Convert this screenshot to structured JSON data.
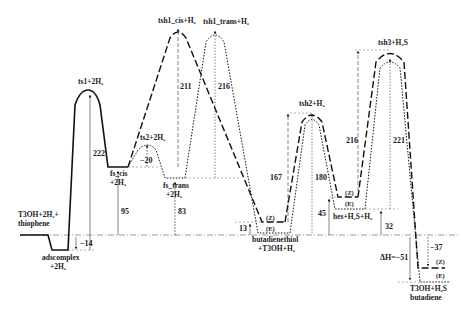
{
  "diagram": {
    "type": "reaction-energy-profile",
    "baseline_label": "T3OH+2H₂+ thiophene",
    "states": [
      {
        "id": "start",
        "label_line1": "T3OH+2H₂+",
        "label_line2": "thiophene",
        "energy": 0
      },
      {
        "id": "adscomplex",
        "label_line1": "adscomplex",
        "label_line2": "+2H₂",
        "energy": -14
      },
      {
        "id": "ts1",
        "label": "ts1+2H₂",
        "barrier": 222
      },
      {
        "id": "fs_cis",
        "label_line1": "fs_cis",
        "label_line2": "+2H₂",
        "energy": 95
      },
      {
        "id": "ts2",
        "label": "ts2+2H₂",
        "barrier": -20
      },
      {
        "id": "fs_trans",
        "label_line1": "fs_trans",
        "label_line2": "+2H₂",
        "energy": 83
      },
      {
        "id": "tsh1_cis",
        "label": "tsh1_cis+H₂",
        "barrier": 211
      },
      {
        "id": "tsh1_trans",
        "label": "tsh1_trans+H₂",
        "barrier": 216
      },
      {
        "id": "butadienethiol",
        "label_line1": "butadienethiol",
        "label_line2": "+T3OH+H₂",
        "energy": 13,
        "isomers": [
          "(Z)",
          "(E)"
        ]
      },
      {
        "id": "tsh2",
        "label": "tsh2+H₂",
        "barriers": [
          167,
          180
        ]
      },
      {
        "id": "hes",
        "label": "hes+H₂S+H₂",
        "energies": [
          45,
          32
        ],
        "isomers": [
          "(Z)",
          "(E)"
        ]
      },
      {
        "id": "tsh3",
        "label": "tsh3+H₂S",
        "barriers": [
          216,
          221
        ]
      },
      {
        "id": "final",
        "label_line1": "T3OH+H₂S",
        "label_line2": "butadiene",
        "energies": [
          -37,
          -51
        ],
        "isomers": [
          "(Z)",
          "(E)"
        ]
      }
    ],
    "annotations": {
      "v_neg14": "−14",
      "v_222": "222",
      "v_95": "95",
      "v_neg20": "−20",
      "v_83": "83",
      "v_211": "211",
      "v_216a": "216",
      "v_13": "13",
      "v_167": "167",
      "v_180": "180",
      "v_45": "45",
      "v_216b": "216",
      "v_221": "221",
      "v_32": "32",
      "v_neg37": "−37",
      "dh": "ΔH=−51"
    },
    "labels": {
      "start1": "T3OH+2H₂+",
      "start2": "thiophene",
      "ads1": "adscomplex",
      "ads2": "+2H₂",
      "ts1": "ts1+2H₂",
      "fscis1": "fs_cis",
      "fscis2": "+2H₂",
      "ts2": "ts2+2H₂",
      "fstrans1": "fs_trans",
      "fstrans2": "+2H₂",
      "tsh1cis": "tsh1_cis+H₂",
      "tsh1trans": "tsh1_trans+H₂",
      "bt1": "butadienethiol",
      "bt2": "+T3OH+H₂",
      "btZ": "(Z)",
      "btE": "(E)",
      "tsh2": "tsh2+H₂",
      "hesZ": "(Z)",
      "hesE": "(E)",
      "hes": "hes+H₂S+H₂",
      "tsh3": "tsh3+H₂S",
      "finZ": "(Z)",
      "finE": "(E)",
      "fin1": "T3OH+H₂S",
      "fin2": "butadiene"
    }
  }
}
